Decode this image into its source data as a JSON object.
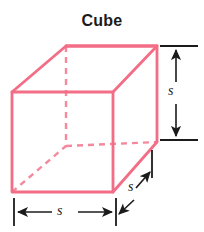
{
  "figure": {
    "title": "Cube",
    "title_color": "#1b1b1b",
    "background_color": "#ffffff",
    "width": 204,
    "height": 232
  },
  "shape": {
    "name": "cube",
    "edge_color": "#f26d85",
    "hidden_edge_color": "#f4889c",
    "edge_width": 2.6,
    "hidden_edge_dash": "6,5",
    "front_face": {
      "left": 12,
      "top": 92,
      "right": 113,
      "bottom": 192
    },
    "back_face": {
      "left": 66,
      "top": 46,
      "right": 157,
      "bottom": 140
    },
    "hidden_vertex": {
      "x": 66,
      "y": 146
    }
  },
  "dimensions": {
    "color": "#1b1b1b",
    "line_width": 1.6,
    "height": {
      "label": "s",
      "orientation": "vertical",
      "from_y": 46,
      "to_y": 140,
      "x": 175
    },
    "width": {
      "label": "s",
      "orientation": "horizontal",
      "from_x": 14,
      "to_x": 116,
      "y": 212
    },
    "depth": {
      "label": "s",
      "orientation": "diagonal",
      "from_x": 120,
      "from_y": 196,
      "to_x": 152,
      "to_y": 166
    }
  }
}
